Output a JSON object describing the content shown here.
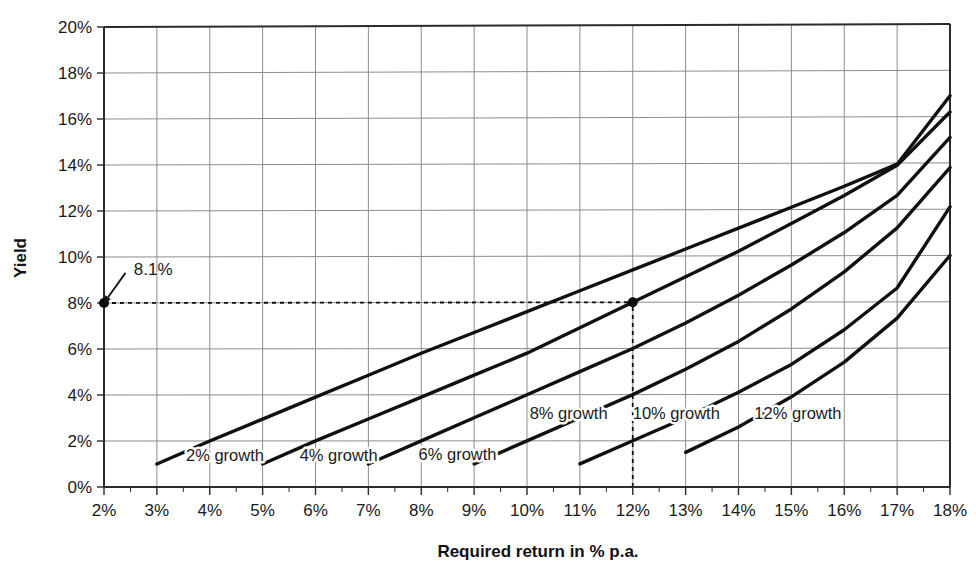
{
  "chart_data": {
    "type": "line",
    "title": "",
    "xlabel": "Required return in % p.a.",
    "ylabel": "Yield",
    "xlim": [
      2,
      18
    ],
    "ylim": [
      0,
      20
    ],
    "xticks": [
      "2%",
      "3%",
      "4%",
      "5%",
      "6%",
      "7%",
      "8%",
      "9%",
      "10%",
      "11%",
      "12%",
      "13%",
      "14%",
      "15%",
      "16%",
      "17%",
      "18%"
    ],
    "yticks": [
      "0%",
      "2%",
      "4%",
      "6%",
      "8%",
      "10%",
      "12%",
      "14%",
      "16%",
      "18%",
      "20%"
    ],
    "xtick_values": [
      2,
      3,
      4,
      5,
      6,
      7,
      8,
      9,
      10,
      11,
      12,
      13,
      14,
      15,
      16,
      17,
      18
    ],
    "ytick_values": [
      0,
      2,
      4,
      6,
      8,
      10,
      12,
      14,
      16,
      18,
      20
    ],
    "grid": true,
    "minor_ticks": true,
    "legend_position": "inline-labels",
    "line_color": "#101010",
    "grid_color": "#8c8c8c",
    "axis_color": "#2b2b2b",
    "series": [
      {
        "name": "2% growth",
        "label": "2% growth",
        "label_x": 3.55,
        "label_y": 1.15,
        "x": [
          3,
          4,
          5,
          6,
          7,
          8,
          9,
          10,
          11,
          12,
          13,
          14,
          15,
          16,
          17,
          18
        ],
        "y": [
          1.0,
          2.0,
          2.95,
          3.9,
          4.85,
          5.8,
          6.7,
          7.6,
          8.5,
          9.4,
          10.3,
          11.2,
          12.1,
          13.0,
          13.95,
          16.9
        ]
      },
      {
        "name": "4% growth",
        "label": "4% growth",
        "label_x": 5.7,
        "label_y": 1.15,
        "x": [
          5,
          6,
          7,
          8,
          9,
          10,
          11,
          12,
          13,
          14,
          15,
          16,
          17,
          18
        ],
        "y": [
          1.0,
          2.0,
          2.95,
          3.9,
          4.85,
          5.8,
          6.9,
          8.0,
          9.1,
          10.2,
          11.4,
          12.6,
          13.9,
          16.2
        ]
      },
      {
        "name": "6% growth",
        "label": "6% growth",
        "label_x": 7.95,
        "label_y": 1.15,
        "x": [
          7,
          8,
          9,
          10,
          11,
          12,
          13,
          14,
          15,
          16,
          17,
          18
        ],
        "y": [
          1.0,
          2.0,
          3.0,
          4.0,
          5.0,
          6.0,
          7.1,
          8.3,
          9.6,
          11.0,
          12.6,
          15.1
        ]
      },
      {
        "name": "8% growth",
        "label": "8% growth",
        "label_x": 10.05,
        "label_y": 2.95,
        "x": [
          9,
          10,
          11,
          12,
          13,
          14,
          15,
          16,
          17,
          18
        ],
        "y": [
          1.0,
          2.0,
          3.0,
          4.0,
          5.1,
          6.3,
          7.7,
          9.3,
          11.2,
          13.8
        ]
      },
      {
        "name": "10% growth",
        "label": "10% growth",
        "label_x": 12.0,
        "label_y": 2.95,
        "x": [
          11,
          12,
          13,
          14,
          15,
          16,
          17,
          18
        ],
        "y": [
          1.0,
          2.0,
          3.0,
          4.1,
          5.3,
          6.8,
          8.6,
          12.1
        ]
      },
      {
        "name": "12% growth",
        "label": "12% growth",
        "label_x": 14.3,
        "label_y": 2.95,
        "x": [
          13,
          14,
          15,
          16,
          17,
          18
        ],
        "y": [
          1.5,
          2.6,
          3.9,
          5.4,
          7.3,
          10.0
        ]
      }
    ],
    "annotations": [
      {
        "name": "yield-callout",
        "text": "8.1%",
        "point_x": 2.0,
        "point_y": 8.0,
        "text_x": 2.45,
        "text_y": 9.45
      }
    ],
    "markers": [
      {
        "name": "marker-axis",
        "x": 2.0,
        "y": 8.0
      },
      {
        "name": "marker-intersection",
        "x": 12.0,
        "y": 8.0
      }
    ],
    "guide_lines": [
      {
        "name": "horizontal-guide",
        "orientation": "horizontal",
        "value": 8.0,
        "from": 2.0,
        "to": 12.0,
        "style": "dashed"
      },
      {
        "name": "vertical-guide",
        "orientation": "vertical",
        "value": 12.0,
        "from": 0.0,
        "to": 8.0,
        "style": "dashed"
      }
    ]
  }
}
